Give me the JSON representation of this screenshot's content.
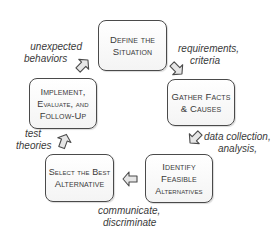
{
  "diagram": {
    "type": "cycle",
    "steps": [
      {
        "id": "define",
        "lines": [
          "Define the",
          "Situation"
        ]
      },
      {
        "id": "gather",
        "lines": [
          "Gather Facts",
          "& Causes"
        ]
      },
      {
        "id": "identify",
        "lines": [
          "Identify",
          "Feasible",
          "Alternatives"
        ]
      },
      {
        "id": "select",
        "lines": [
          "Select the Best",
          "Alternative"
        ]
      },
      {
        "id": "implement",
        "lines": [
          "Implement,",
          "Evaluate, and",
          "Follow-Up"
        ]
      }
    ],
    "transitions": [
      {
        "from": "define",
        "to": "gather",
        "lines": [
          "requirements,",
          "criteria"
        ]
      },
      {
        "from": "gather",
        "to": "identify",
        "lines": [
          "data collection,",
          "analysis,"
        ]
      },
      {
        "from": "identify",
        "to": "select",
        "lines": [
          "communicate,",
          "discriminate"
        ]
      },
      {
        "from": "select",
        "to": "implement",
        "lines": [
          "test",
          "theories"
        ]
      },
      {
        "from": "implement",
        "to": "define",
        "lines": [
          "unexpected",
          "behaviors"
        ]
      }
    ],
    "colors": {
      "border": "#4a4a4a",
      "box_fill": "#f7f7f7",
      "arrow_fill": "#e6e6e6",
      "text": "#3a3a3a"
    }
  }
}
